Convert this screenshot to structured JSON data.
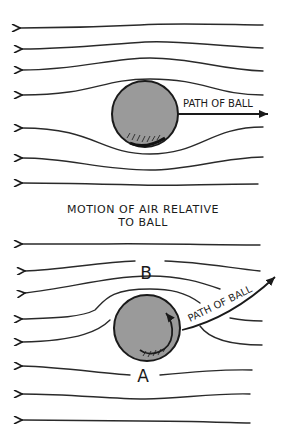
{
  "top_diagram": {
    "path_label": "PATH OF BALL",
    "ball_color": "#9a9a9a",
    "streamline_count": 7
  },
  "caption": {
    "line1": "MOTION OF AIR RELATIVE",
    "line2": "TO BALL"
  },
  "bottom_diagram": {
    "path_label": "PATH OF BALL",
    "label_above": "B",
    "label_below": "A",
    "ball_color": "#9a9a9a",
    "streamline_count": 8,
    "spin_direction": "counterclockwise"
  }
}
